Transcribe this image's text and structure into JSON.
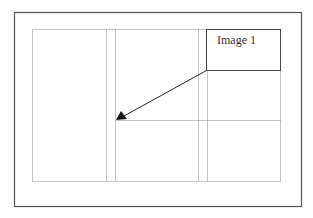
{
  "diagram": {
    "image_box_label": "Image 1",
    "colors": {
      "frame": "#555555",
      "dotted": "#888888",
      "arrow": "#222222"
    }
  }
}
